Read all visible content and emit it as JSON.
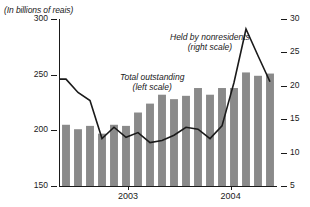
{
  "figure": {
    "title_clipped": "Brazil",
    "units_label": "(In billions of reais)",
    "xaxis_ticks": [
      {
        "label": "2003",
        "x_frac": 0.315
      },
      {
        "label": "2004",
        "x_frac": 0.79
      }
    ]
  },
  "annotations": {
    "total_line1": "Total outstanding",
    "total_line2": "(left scale)",
    "nonres_line1": "Held by nonresidents",
    "nonres_line2": "(right scale)"
  },
  "colors": {
    "bar": "#8a8a8a",
    "line": "#1a1a1a",
    "axis": "#1a1a1a",
    "background": "#ffffff"
  },
  "chart_data": {
    "type": "bar",
    "title": "",
    "subtitle": "(In billions of reais)",
    "xlabel": "",
    "ylabel": "",
    "grid": false,
    "legend": "annotations-inline",
    "categories": [
      "2003-01",
      "2003-02",
      "2003-03",
      "2003-04",
      "2003-05",
      "2003-06",
      "2003-07",
      "2003-08",
      "2003-09",
      "2003-10",
      "2003-11",
      "2003-12",
      "2004-01",
      "2004-02",
      "2004-03",
      "2004-04",
      "2004-05",
      "2004-06"
    ],
    "left_axis": {
      "label": "Total outstanding (left scale)",
      "ticks": [
        150,
        200,
        250,
        300
      ],
      "ylim": [
        150,
        300
      ],
      "unit": "billions of reais"
    },
    "right_axis": {
      "label": "Held by nonresidents (right scale)",
      "ticks": [
        5,
        10,
        15,
        20,
        25,
        30
      ],
      "ylim": [
        5,
        30
      ],
      "unit": "billions of reais"
    },
    "series": [
      {
        "name": "Total outstanding",
        "type": "bar",
        "axis": "left",
        "values": [
          205,
          201,
          204,
          197,
          205,
          204,
          216,
          224,
          232,
          228,
          231,
          238,
          232,
          238,
          238,
          252,
          249,
          251
        ]
      },
      {
        "name": "Held by nonresidents",
        "type": "line",
        "axis": "right",
        "values": [
          21.0,
          19.0,
          17.8,
          12.1,
          13.8,
          12.3,
          13.0,
          11.5,
          11.8,
          12.6,
          13.8,
          13.5,
          12.1,
          14.0,
          20.5,
          28.5,
          24.5,
          20.6
        ]
      }
    ]
  }
}
